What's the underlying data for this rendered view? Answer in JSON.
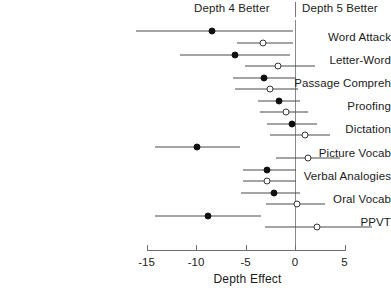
{
  "header": {
    "left_label": "Depth 4 Better",
    "right_label": "Depth 5 Better"
  },
  "axis": {
    "xlabel": "Depth Effect",
    "ticks": [
      "-15",
      "-10",
      "-5",
      "0",
      "5"
    ]
  },
  "chart_data": {
    "type": "scatter",
    "title": "",
    "subtitle": "",
    "xlabel": "Depth Effect",
    "ylabel": "",
    "xlim": [
      -15,
      5
    ],
    "xticks": [
      -15,
      -10,
      -5,
      0,
      5
    ],
    "grid": false,
    "reference_line": 0,
    "annotations": [
      "Depth 4 Better",
      "Depth 5 Better"
    ],
    "legend": [
      {
        "name": "Filled marker estimate",
        "marker": "filled-circle"
      },
      {
        "name": "Open marker estimate",
        "marker": "open-circle"
      }
    ],
    "categories": [
      "Word Attack",
      "Letter-Word",
      "Passage Compreh",
      "Proofing",
      "Dictation",
      "Picture Vocab",
      "Verbal Analogies",
      "Oral Vocab",
      "PPVT"
    ],
    "series": [
      {
        "name": "Filled",
        "marker": "filled-circle",
        "points": [
          {
            "category": "Word Attack",
            "estimate": -8.4,
            "ci_low": -16.1,
            "ci_high": -0.2
          },
          {
            "category": "Letter-Word",
            "estimate": -6.1,
            "ci_low": -11.6,
            "ci_high": -0.5
          },
          {
            "category": "Passage Compreh",
            "estimate": -3.1,
            "ci_low": -6.3,
            "ci_high": 0.1
          },
          {
            "category": "Proofing",
            "estimate": -1.6,
            "ci_low": -3.7,
            "ci_high": 0.5
          },
          {
            "category": "Dictation",
            "estimate": -0.3,
            "ci_low": -2.8,
            "ci_high": 2.2
          },
          {
            "category": "Picture Vocab",
            "estimate": -9.9,
            "ci_low": -14.1,
            "ci_high": -5.6
          },
          {
            "category": "Verbal Analogies",
            "estimate": -2.8,
            "ci_low": -5.3,
            "ci_high": 0.1
          },
          {
            "category": "Oral Vocab",
            "estimate": -2.1,
            "ci_low": -5.5,
            "ci_high": 0.5
          },
          {
            "category": "PPVT",
            "estimate": -8.8,
            "ci_low": -14.1,
            "ci_high": -3.4
          }
        ]
      },
      {
        "name": "Open",
        "marker": "open-circle",
        "points": [
          {
            "category": "Word Attack",
            "estimate": -3.2,
            "ci_low": -5.9,
            "ci_high": -0.2
          },
          {
            "category": "Letter-Word",
            "estimate": -1.7,
            "ci_low": -5.1,
            "ci_high": 2.0
          },
          {
            "category": "Passage Compreh",
            "estimate": -2.5,
            "ci_low": -6.1,
            "ci_high": 0.3
          },
          {
            "category": "Proofing",
            "estimate": -0.9,
            "ci_low": -3.5,
            "ci_high": 1.3
          },
          {
            "category": "Dictation",
            "estimate": 1.0,
            "ci_low": -2.5,
            "ci_high": 3.5
          },
          {
            "category": "Picture Vocab",
            "estimate": 1.3,
            "ci_low": -1.9,
            "ci_high": 4.5
          },
          {
            "category": "Verbal Analogies",
            "estimate": -2.8,
            "ci_low": -5.3,
            "ci_high": 0.1
          },
          {
            "category": "Oral Vocab",
            "estimate": 0.2,
            "ci_low": -2.9,
            "ci_high": 3.0
          },
          {
            "category": "PPVT",
            "estimate": 2.2,
            "ci_low": -3.0,
            "ci_high": 7.8
          }
        ]
      }
    ]
  }
}
